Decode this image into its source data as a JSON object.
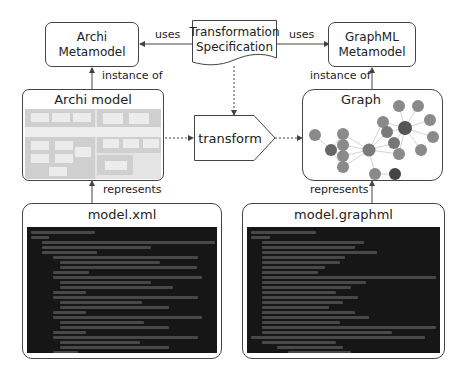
{
  "nodes": {
    "archi_metamodel": {
      "label_line1": "Archi",
      "label_line2": "Metamodel"
    },
    "transformation_spec": {
      "label_line1": "Transformation",
      "label_line2": "Specification"
    },
    "graphml_metamodel": {
      "label_line1": "GraphML",
      "label_line2": "Metamodel"
    },
    "archi_model": {
      "title": "Archi model"
    },
    "transform": {
      "label": "transform"
    },
    "graph": {
      "title": "Graph"
    },
    "model_xml": {
      "title": "model.xml"
    },
    "model_graphml": {
      "title": "model.graphml"
    }
  },
  "edges": {
    "uses_left": "uses",
    "uses_right": "uses",
    "instance_of_left": "instance of",
    "instance_of_right": "instance of",
    "represents_left": "represents",
    "represents_right": "represents"
  },
  "colors": {
    "border": "#444444",
    "graph_node_light": "#8a8a8a",
    "graph_node_dark": "#555555",
    "code_bg": "#161616",
    "archi_bg": "#d9d9d9"
  }
}
